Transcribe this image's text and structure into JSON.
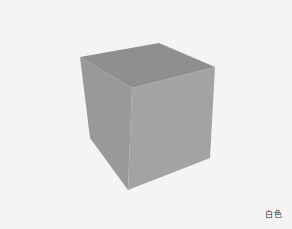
{
  "scene": {
    "object": "cube",
    "colors": {
      "background": "#f4f4f4",
      "top_face": "#8e8e8e",
      "left_face": "#989898",
      "right_face": "#a4a4a4"
    }
  },
  "caption": {
    "label": "白色"
  }
}
